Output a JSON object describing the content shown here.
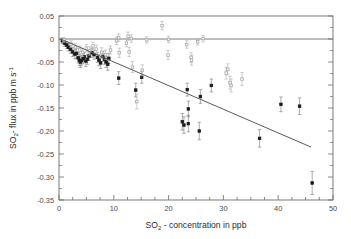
{
  "chart_data": {
    "type": "scatter",
    "title": "",
    "xlabel": "SO2 - concentration in ppb",
    "ylabel": "SO2- flux in ppb m s-1",
    "xlabel_parts": {
      "base": "SO",
      "sub": "2",
      "rest": " - concentration in ppb"
    },
    "ylabel_parts": {
      "base": "SO",
      "sub": "2",
      "mid": "- flux in ppb m s",
      "sup": "-1"
    },
    "xlim": [
      0,
      50
    ],
    "ylim": [
      -0.35,
      0.05
    ],
    "xticks": [
      0,
      10,
      20,
      30,
      40,
      50
    ],
    "xtick_labels": [
      "0",
      "10",
      "20",
      "30",
      "40",
      "50"
    ],
    "xminor_step": 2.5,
    "yticks": [
      0.05,
      0,
      -0.05,
      -0.1,
      -0.15,
      -0.2,
      -0.25,
      -0.3,
      -0.35
    ],
    "ytick_labels": [
      "0.05",
      "0",
      "-0.05",
      "-0.10",
      "-0.15",
      "-0.20",
      "-0.25",
      "-0.30",
      "-0.35"
    ],
    "grid": false,
    "legend_position": "none",
    "zero_line": {
      "y": 0,
      "color": "#6d6d6d",
      "label": "zero-flux-reference-line"
    },
    "regression_line": {
      "x": [
        0.3,
        46.0
      ],
      "y": [
        0.0,
        -0.235
      ],
      "color": "#5a5a5a",
      "label": "linear-regression-fit"
    },
    "marker_colors": {
      "filled": "#1a1a1a",
      "open": "#a8a8a8",
      "errorbar": "#8a8a8a"
    },
    "series": [
      {
        "name": "filled",
        "marker": "filled-square",
        "color": "#1a1a1a",
        "points": [
          {
            "x": 0.6,
            "y": -0.004,
            "err": 0.006
          },
          {
            "x": 1.0,
            "y": -0.009,
            "err": 0.007
          },
          {
            "x": 1.4,
            "y": -0.013,
            "err": 0.008
          },
          {
            "x": 1.7,
            "y": -0.018,
            "err": 0.008
          },
          {
            "x": 2.1,
            "y": -0.022,
            "err": 0.009
          },
          {
            "x": 2.5,
            "y": -0.028,
            "err": 0.01
          },
          {
            "x": 2.9,
            "y": -0.033,
            "err": 0.01
          },
          {
            "x": 3.2,
            "y": -0.031,
            "err": 0.011
          },
          {
            "x": 3.5,
            "y": -0.041,
            "err": 0.011
          },
          {
            "x": 3.7,
            "y": -0.046,
            "err": 0.012
          },
          {
            "x": 3.9,
            "y": -0.05,
            "err": 0.012
          },
          {
            "x": 4.1,
            "y": -0.047,
            "err": 0.011
          },
          {
            "x": 4.4,
            "y": -0.043,
            "err": 0.011
          },
          {
            "x": 4.6,
            "y": -0.039,
            "err": 0.01
          },
          {
            "x": 4.9,
            "y": -0.048,
            "err": 0.012
          },
          {
            "x": 5.2,
            "y": -0.044,
            "err": 0.011
          },
          {
            "x": 5.5,
            "y": -0.037,
            "err": 0.01
          },
          {
            "x": 6.0,
            "y": -0.03,
            "err": 0.01
          },
          {
            "x": 6.4,
            "y": -0.034,
            "err": 0.01
          },
          {
            "x": 7.0,
            "y": -0.04,
            "err": 0.011
          },
          {
            "x": 7.3,
            "y": -0.046,
            "err": 0.012
          },
          {
            "x": 7.6,
            "y": -0.052,
            "err": 0.012
          },
          {
            "x": 8.0,
            "y": -0.038,
            "err": 0.011
          },
          {
            "x": 8.3,
            "y": -0.044,
            "err": 0.011
          },
          {
            "x": 8.6,
            "y": -0.05,
            "err": 0.012
          },
          {
            "x": 8.9,
            "y": -0.055,
            "err": 0.013
          },
          {
            "x": 9.1,
            "y": -0.042,
            "err": 0.011
          },
          {
            "x": 10.9,
            "y": -0.085,
            "err": 0.014
          },
          {
            "x": 14.0,
            "y": -0.111,
            "err": 0.015
          },
          {
            "x": 15.1,
            "y": -0.083,
            "err": 0.013
          },
          {
            "x": 22.5,
            "y": -0.18,
            "err": 0.018
          },
          {
            "x": 22.8,
            "y": -0.187,
            "err": 0.018
          },
          {
            "x": 23.6,
            "y": -0.152,
            "err": 0.017
          },
          {
            "x": 23.6,
            "y": -0.184,
            "err": 0.018
          },
          {
            "x": 23.4,
            "y": -0.11,
            "err": 0.014
          },
          {
            "x": 25.6,
            "y": -0.2,
            "err": 0.019
          },
          {
            "x": 25.8,
            "y": -0.125,
            "err": 0.015
          },
          {
            "x": 27.8,
            "y": -0.101,
            "err": 0.014
          },
          {
            "x": 36.6,
            "y": -0.216,
            "err": 0.019
          },
          {
            "x": 40.5,
            "y": -0.142,
            "err": 0.016
          },
          {
            "x": 43.9,
            "y": -0.146,
            "err": 0.018
          },
          {
            "x": 46.2,
            "y": -0.313,
            "err": 0.025
          }
        ]
      },
      {
        "name": "open",
        "marker": "open-square",
        "color": "#a8a8a8",
        "points": [
          {
            "x": 0.9,
            "y": -0.002,
            "err": 0.005
          },
          {
            "x": 2.2,
            "y": -0.011,
            "err": 0.007
          },
          {
            "x": 3.0,
            "y": -0.018,
            "err": 0.008
          },
          {
            "x": 3.8,
            "y": -0.024,
            "err": 0.009
          },
          {
            "x": 4.3,
            "y": -0.029,
            "err": 0.009
          },
          {
            "x": 5.0,
            "y": -0.02,
            "err": 0.008
          },
          {
            "x": 5.6,
            "y": -0.026,
            "err": 0.009
          },
          {
            "x": 6.2,
            "y": -0.015,
            "err": 0.008
          },
          {
            "x": 6.8,
            "y": -0.022,
            "err": 0.009
          },
          {
            "x": 7.8,
            "y": -0.029,
            "err": 0.01
          },
          {
            "x": 8.5,
            "y": -0.034,
            "err": 0.01
          },
          {
            "x": 9.4,
            "y": -0.024,
            "err": 0.009
          },
          {
            "x": 10.5,
            "y": -0.004,
            "err": 0.008
          },
          {
            "x": 10.9,
            "y": 0.003,
            "err": 0.008
          },
          {
            "x": 11.0,
            "y": -0.03,
            "err": 0.01
          },
          {
            "x": 12.3,
            "y": -0.009,
            "err": 0.008
          },
          {
            "x": 12.6,
            "y": 0.006,
            "err": 0.009
          },
          {
            "x": 12.8,
            "y": -0.028,
            "err": 0.01
          },
          {
            "x": 13.2,
            "y": 0.001,
            "err": 0.008
          },
          {
            "x": 13.4,
            "y": -0.061,
            "err": 0.012
          },
          {
            "x": 14.2,
            "y": -0.136,
            "err": 0.016
          },
          {
            "x": 15.2,
            "y": -0.068,
            "err": 0.012
          },
          {
            "x": 16.0,
            "y": -0.002,
            "err": 0.007
          },
          {
            "x": 18.8,
            "y": 0.029,
            "err": 0.009
          },
          {
            "x": 19.9,
            "y": -0.035,
            "err": 0.01
          },
          {
            "x": 20.0,
            "y": -0.001,
            "err": 0.007
          },
          {
            "x": 23.3,
            "y": -0.012,
            "err": 0.008
          },
          {
            "x": 24.1,
            "y": -0.04,
            "err": 0.011
          },
          {
            "x": 24.2,
            "y": -0.046,
            "err": 0.011
          },
          {
            "x": 25.3,
            "y": -0.006,
            "err": 0.007
          },
          {
            "x": 26.3,
            "y": 0.001,
            "err": 0.007
          },
          {
            "x": 30.5,
            "y": -0.074,
            "err": 0.013
          },
          {
            "x": 30.8,
            "y": -0.066,
            "err": 0.012
          },
          {
            "x": 31.2,
            "y": -0.095,
            "err": 0.014
          },
          {
            "x": 31.4,
            "y": -0.101,
            "err": 0.014
          },
          {
            "x": 33.4,
            "y": -0.087,
            "err": 0.014
          }
        ]
      }
    ]
  }
}
